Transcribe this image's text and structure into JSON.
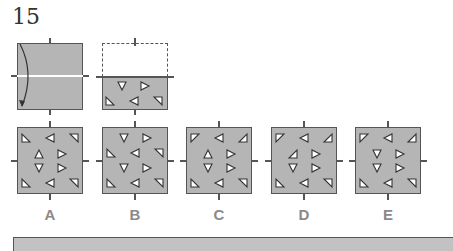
{
  "question": {
    "number": "15"
  },
  "step1": {
    "description": "square folded along horizontal line, top half folded down",
    "arrow": "curved-arrow-down"
  },
  "step2": {
    "folded_triangles": [
      {
        "shape": "down",
        "x": 20,
        "y": 9
      },
      {
        "shape": "right",
        "x": 43,
        "y": 9
      },
      {
        "shape": "bl",
        "x": 8,
        "y": 24
      },
      {
        "shape": "left",
        "x": 32,
        "y": 24
      },
      {
        "shape": "tr",
        "x": 56,
        "y": 24
      }
    ]
  },
  "options": [
    {
      "label": "A",
      "x": 17,
      "triangles": [
        {
          "shape": "bl",
          "x": 9,
          "y": 11
        },
        {
          "shape": "left",
          "x": 33,
          "y": 11
        },
        {
          "shape": "tr",
          "x": 57,
          "y": 11
        },
        {
          "shape": "up",
          "x": 22,
          "y": 27
        },
        {
          "shape": "right",
          "x": 45,
          "y": 27
        },
        {
          "shape": "down",
          "x": 22,
          "y": 41
        },
        {
          "shape": "right",
          "x": 45,
          "y": 41
        },
        {
          "shape": "bl",
          "x": 9,
          "y": 56
        },
        {
          "shape": "left",
          "x": 33,
          "y": 56
        },
        {
          "shape": "tr",
          "x": 57,
          "y": 56
        }
      ]
    },
    {
      "label": "B",
      "x": 102,
      "triangles": [
        {
          "shape": "down",
          "x": 22,
          "y": 11
        },
        {
          "shape": "right",
          "x": 45,
          "y": 11
        },
        {
          "shape": "bl",
          "x": 9,
          "y": 26
        },
        {
          "shape": "left",
          "x": 33,
          "y": 26
        },
        {
          "shape": "tr",
          "x": 57,
          "y": 26
        },
        {
          "shape": "down",
          "x": 22,
          "y": 41
        },
        {
          "shape": "right",
          "x": 45,
          "y": 41
        },
        {
          "shape": "bl",
          "x": 9,
          "y": 56
        },
        {
          "shape": "left",
          "x": 33,
          "y": 56
        },
        {
          "shape": "tr",
          "x": 57,
          "y": 56
        }
      ]
    },
    {
      "label": "C",
      "x": 186,
      "triangles": [
        {
          "shape": "tl",
          "x": 9,
          "y": 11
        },
        {
          "shape": "left",
          "x": 33,
          "y": 11
        },
        {
          "shape": "br",
          "x": 57,
          "y": 11
        },
        {
          "shape": "up",
          "x": 22,
          "y": 27
        },
        {
          "shape": "right",
          "x": 45,
          "y": 27
        },
        {
          "shape": "down",
          "x": 22,
          "y": 41
        },
        {
          "shape": "right",
          "x": 45,
          "y": 41
        },
        {
          "shape": "bl",
          "x": 9,
          "y": 56
        },
        {
          "shape": "left",
          "x": 33,
          "y": 56
        },
        {
          "shape": "tr",
          "x": 57,
          "y": 56
        }
      ]
    },
    {
      "label": "D",
      "x": 271,
      "triangles": [
        {
          "shape": "tl",
          "x": 9,
          "y": 11
        },
        {
          "shape": "left",
          "x": 33,
          "y": 11
        },
        {
          "shape": "br",
          "x": 57,
          "y": 11
        },
        {
          "shape": "br",
          "x": 22,
          "y": 27
        },
        {
          "shape": "right",
          "x": 45,
          "y": 27
        },
        {
          "shape": "down",
          "x": 22,
          "y": 41
        },
        {
          "shape": "right",
          "x": 45,
          "y": 41
        },
        {
          "shape": "bl",
          "x": 9,
          "y": 56
        },
        {
          "shape": "left",
          "x": 33,
          "y": 56
        },
        {
          "shape": "tr",
          "x": 57,
          "y": 56
        }
      ]
    },
    {
      "label": "E",
      "x": 355,
      "triangles": [
        {
          "shape": "tl",
          "x": 9,
          "y": 11
        },
        {
          "shape": "left",
          "x": 33,
          "y": 11
        },
        {
          "shape": "br",
          "x": 57,
          "y": 11
        },
        {
          "shape": "down",
          "x": 22,
          "y": 27
        },
        {
          "shape": "right",
          "x": 45,
          "y": 27
        },
        {
          "shape": "down",
          "x": 22,
          "y": 41
        },
        {
          "shape": "right",
          "x": 45,
          "y": 41
        },
        {
          "shape": "bl",
          "x": 9,
          "y": 56
        },
        {
          "shape": "left",
          "x": 33,
          "y": 56
        },
        {
          "shape": "tr",
          "x": 57,
          "y": 56
        }
      ]
    }
  ],
  "colors": {
    "paper": "#b5b5b5",
    "outline": "#555555",
    "label": "#8a8a8a",
    "fold_line": "#ffffff"
  }
}
